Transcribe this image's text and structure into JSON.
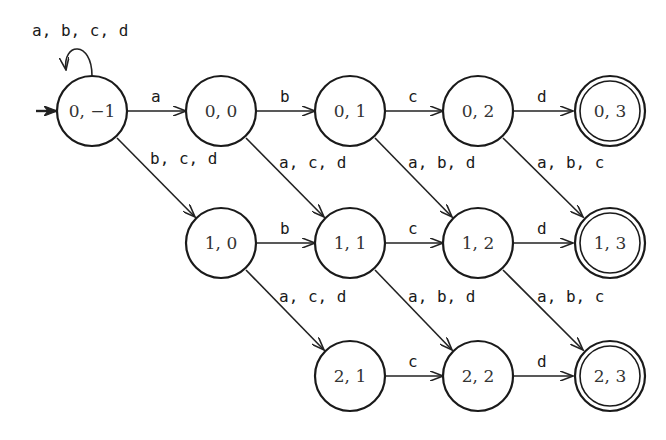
{
  "diagram": {
    "type": "nondeterministic finite automaton",
    "start_state": "s_0_m1",
    "states": [
      {
        "id": "s_0_m1",
        "label": "0, −1",
        "x": 92,
        "y": 111,
        "accepting": false
      },
      {
        "id": "s_0_0",
        "label": "0, 0",
        "x": 221,
        "y": 111,
        "accepting": false
      },
      {
        "id": "s_0_1",
        "label": "0, 1",
        "x": 350,
        "y": 111,
        "accepting": false
      },
      {
        "id": "s_0_2",
        "label": "0, 2",
        "x": 478,
        "y": 111,
        "accepting": false
      },
      {
        "id": "s_0_3",
        "label": "0, 3",
        "x": 610,
        "y": 111,
        "accepting": true
      },
      {
        "id": "s_1_0",
        "label": "1, 0",
        "x": 221,
        "y": 243,
        "accepting": false
      },
      {
        "id": "s_1_1",
        "label": "1, 1",
        "x": 350,
        "y": 243,
        "accepting": false
      },
      {
        "id": "s_1_2",
        "label": "1, 2",
        "x": 478,
        "y": 243,
        "accepting": false
      },
      {
        "id": "s_1_3",
        "label": "1, 3",
        "x": 610,
        "y": 243,
        "accepting": true
      },
      {
        "id": "s_2_1",
        "label": "2, 1",
        "x": 350,
        "y": 376,
        "accepting": false
      },
      {
        "id": "s_2_2",
        "label": "2, 2",
        "x": 478,
        "y": 376,
        "accepting": false
      },
      {
        "id": "s_2_3",
        "label": "2, 3",
        "x": 610,
        "y": 376,
        "accepting": true
      }
    ],
    "edges": [
      {
        "from": "s_0_m1",
        "to": "s_0_m1",
        "label": "a, b, c, d"
      },
      {
        "from": "s_0_m1",
        "to": "s_0_0",
        "label": "a"
      },
      {
        "from": "s_0_0",
        "to": "s_0_1",
        "label": "b"
      },
      {
        "from": "s_0_1",
        "to": "s_0_2",
        "label": "c"
      },
      {
        "from": "s_0_2",
        "to": "s_0_3",
        "label": "d"
      },
      {
        "from": "s_0_m1",
        "to": "s_1_0",
        "label": "b, c, d"
      },
      {
        "from": "s_0_0",
        "to": "s_1_1",
        "label": "a, c, d"
      },
      {
        "from": "s_0_1",
        "to": "s_1_2",
        "label": "a, b, d"
      },
      {
        "from": "s_0_2",
        "to": "s_1_3",
        "label": "a, b, c"
      },
      {
        "from": "s_1_0",
        "to": "s_1_1",
        "label": "b"
      },
      {
        "from": "s_1_1",
        "to": "s_1_2",
        "label": "c"
      },
      {
        "from": "s_1_2",
        "to": "s_1_3",
        "label": "d"
      },
      {
        "from": "s_1_0",
        "to": "s_2_1",
        "label": "a, c, d"
      },
      {
        "from": "s_1_1",
        "to": "s_2_2",
        "label": "a, b, d"
      },
      {
        "from": "s_1_2",
        "to": "s_2_3",
        "label": "a, b, c"
      },
      {
        "from": "s_2_1",
        "to": "s_2_2",
        "label": "c"
      },
      {
        "from": "s_2_2",
        "to": "s_2_3",
        "label": "d"
      }
    ]
  },
  "labels": {
    "self_loop": "a, b, c, d",
    "e_m1_00": "a",
    "e_00_01": "b",
    "e_01_02": "c",
    "e_02_03": "d",
    "e_m1_10": "b, c, d",
    "e_00_11": "a, c, d",
    "e_01_12": "a, b, d",
    "e_02_13": "a, b, c",
    "e_10_11": "b",
    "e_11_12": "c",
    "e_12_13": "d",
    "e_10_21": "a, c, d",
    "e_11_22": "a, b, d",
    "e_12_23": "a, b, c",
    "e_21_22": "c",
    "e_22_23": "d"
  },
  "state_labels": {
    "s_0_m1": "0, −1",
    "s_0_0": "0, 0",
    "s_0_1": "0, 1",
    "s_0_2": "0, 2",
    "s_0_3": "0, 3",
    "s_1_0": "1, 0",
    "s_1_1": "1, 1",
    "s_1_2": "1, 2",
    "s_1_3": "1, 3",
    "s_2_1": "2, 1",
    "s_2_2": "2, 2",
    "s_2_3": "2, 3"
  }
}
